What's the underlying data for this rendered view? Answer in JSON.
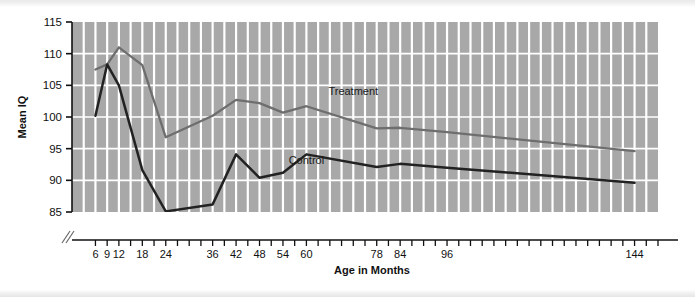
{
  "chart_data": {
    "type": "line",
    "title": "",
    "xlabel": "Age in Months",
    "ylabel": "Mean IQ",
    "xlim": [
      0,
      150
    ],
    "ylim": [
      85,
      115
    ],
    "yticks": [
      85,
      90,
      95,
      100,
      105,
      110,
      115
    ],
    "xticks": [
      6,
      9,
      12,
      18,
      24,
      36,
      42,
      48,
      54,
      60,
      78,
      84,
      96,
      144
    ],
    "xtick_labels": [
      "6",
      "9",
      "12",
      "18",
      "24",
      "36",
      "42",
      "48",
      "54",
      "60",
      "78",
      "84",
      "96",
      "144"
    ],
    "grid": true,
    "grid_color": "#ffffff",
    "plot_background": "#a8a8a8",
    "legend_position": "inline-annotation",
    "series": [
      {
        "name": "Treatment",
        "color": "#6e6e6e",
        "x": [
          6,
          9,
          12,
          18,
          24,
          36,
          42,
          48,
          54,
          60,
          78,
          84,
          96,
          144
        ],
        "values": [
          107.5,
          108.3,
          111.0,
          108.2,
          96.8,
          100.2,
          102.7,
          102.2,
          100.7,
          101.7,
          98.2,
          98.3,
          97.6,
          94.6
        ]
      },
      {
        "name": "Control",
        "color": "#222222",
        "x": [
          6,
          9,
          12,
          18,
          24,
          36,
          42,
          48,
          54,
          60,
          78,
          84,
          96,
          144
        ],
        "values": [
          100.2,
          108.3,
          105.0,
          91.6,
          85.1,
          86.2,
          94.1,
          90.4,
          91.2,
          94.1,
          92.1,
          92.6,
          92.0,
          89.6
        ]
      }
    ],
    "annotations": [
      {
        "text": "Treatment",
        "x_month": 72,
        "y_value": 103.4
      },
      {
        "text": "Control",
        "x_month": 60,
        "y_value": 92.6
      }
    ]
  }
}
